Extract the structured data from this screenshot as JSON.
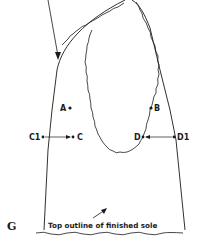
{
  "figure": {
    "label": "G",
    "caption": "Top outline of finished sole"
  },
  "points": {
    "A": "A",
    "B": "B",
    "C": "C",
    "C1": "C1",
    "D": "D",
    "D1": "D1"
  },
  "colors": {
    "ink": "#1a1a1a",
    "background": "#ffffff"
  }
}
